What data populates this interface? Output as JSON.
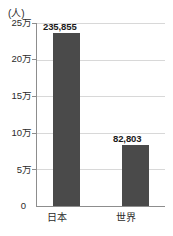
{
  "chart_data": {
    "type": "bar",
    "title": "",
    "subtitle": "",
    "xlabel": "",
    "ylabel": "(人)",
    "unit_label": "(人)",
    "categories": [
      "日本",
      "世界"
    ],
    "values": [
      235855,
      82803
    ],
    "value_labels": [
      "235,855",
      "82,803"
    ],
    "ylim": [
      0,
      250000
    ],
    "ytick_values": [
      0,
      50000,
      100000,
      150000,
      200000,
      250000
    ],
    "ytick_labels": [
      "0",
      "5万",
      "10万",
      "15万",
      "20万",
      "25万"
    ],
    "grid": true,
    "grid_axis": "y",
    "legend": false,
    "legend_position": "none",
    "series": [
      {
        "name": "",
        "values": [
          235855,
          82803
        ]
      }
    ]
  },
  "colors": {
    "bar": "#4a4a4a",
    "gridline": "#d8d8d8",
    "axis": "#8d8d8d",
    "text": "#2b2b2b",
    "value_text": "#1a1a1a",
    "background": "#ffffff"
  }
}
